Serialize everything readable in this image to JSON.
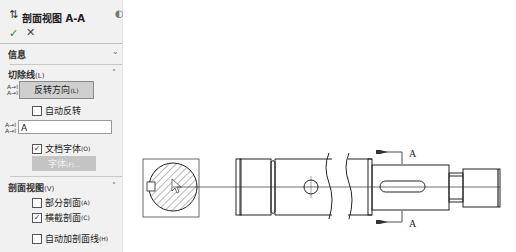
{
  "panel": {
    "title": "剖面视图 A-A",
    "ok_icon": "✓",
    "cancel_icon": "✕",
    "help_icon": "?",
    "sections": {
      "info": {
        "label": "信息",
        "chevron": "⌄"
      },
      "cutting_line": {
        "label": "切除线",
        "shortcut": "(L)",
        "chevron": "˄",
        "flip_direction": {
          "label": "反转方向",
          "shortcut": "(L)"
        },
        "auto_flip": {
          "label": "自动反转",
          "checked": false
        },
        "label_value": "A",
        "doc_font": {
          "label": "文档字体",
          "shortcut": "(O)",
          "checked": true
        },
        "font_button": {
          "label": "字体",
          "shortcut": "(F)..."
        }
      },
      "section_view": {
        "label": "剖面视图",
        "shortcut": "(V)",
        "chevron": "˄",
        "partial_section": {
          "label": "部分剖面",
          "shortcut": "(A)",
          "checked": false
        },
        "slice_section": {
          "label": "横截剖面",
          "shortcut": "(C)",
          "checked": true
        },
        "auto_hatching": {
          "label": "自动加剖面线",
          "shortcut": "(H)",
          "checked": false
        }
      }
    }
  },
  "drawing": {
    "section_label_top": "A",
    "section_label_bottom": "A"
  }
}
